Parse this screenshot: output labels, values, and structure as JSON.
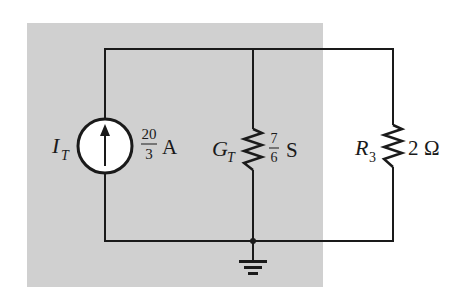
{
  "colors": {
    "background": "#ffffff",
    "shaded_region": "#d0d0d0",
    "wire": "#1a1a1a",
    "source_fill": "#ffffff"
  },
  "components": {
    "source": {
      "type": "current-source",
      "symbol": "I",
      "subscript": "T",
      "value_numerator": "20",
      "value_denominator": "3",
      "unit": "A",
      "direction": "up"
    },
    "conductance": {
      "type": "resistor",
      "symbol": "G",
      "subscript": "T",
      "value_numerator": "7",
      "value_denominator": "6",
      "unit": "S"
    },
    "resistor": {
      "type": "resistor",
      "symbol": "R",
      "subscript": "3",
      "value": "2",
      "unit": "Ω"
    },
    "ground": {
      "type": "ground"
    }
  }
}
